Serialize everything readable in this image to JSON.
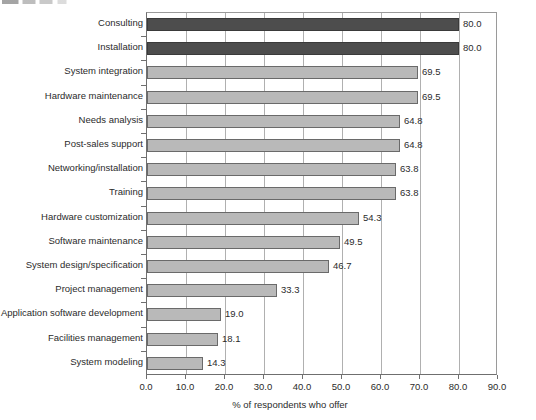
{
  "figure": {
    "caption_sliver": "",
    "background_color": "#ffffff"
  },
  "colors": {
    "bar_light": "#b9b9b9",
    "bar_dark": "#4d4d4d",
    "bar_border": "#6a6a6a",
    "gridline": "#b0b0b0",
    "axis": "#6f6f6f",
    "text": "#2b2b2b"
  },
  "chart_data": {
    "type": "bar",
    "orientation": "horizontal",
    "title": "",
    "subtitle": "",
    "xlabel": "% of respondents who offer",
    "ylabel": "",
    "xlim": [
      0.0,
      90.0
    ],
    "xticks": [
      "0.0",
      "10.0",
      "20.0",
      "30.0",
      "40.0",
      "50.0",
      "60.0",
      "70.0",
      "80.0",
      "90.0"
    ],
    "xtick_values": [
      0,
      10,
      20,
      30,
      40,
      50,
      60,
      70,
      80,
      90
    ],
    "grid": "vertical",
    "legend": "none",
    "categories": [
      "Consulting",
      "Installation",
      "System integration",
      "Hardware maintenance",
      "Needs analysis",
      "Post-sales support",
      "Networking/installation",
      "Training",
      "Hardware customization",
      "Software maintenance",
      "System design/specification",
      "Project management",
      "Application software development",
      "Facilities management",
      "System modeling"
    ],
    "values": [
      80.0,
      80.0,
      69.5,
      69.5,
      64.8,
      64.8,
      63.8,
      63.8,
      54.3,
      49.5,
      46.7,
      33.3,
      19.0,
      18.1,
      14.3
    ],
    "value_labels": [
      "80.0",
      "80.0",
      "69.5",
      "69.5",
      "64.8",
      "64.8",
      "63.8",
      "63.8",
      "54.3",
      "49.5",
      "46.7",
      "33.3",
      "19.0",
      "18.1",
      "14.3"
    ],
    "bar_styles": [
      "dark",
      "dark",
      "light",
      "light",
      "light",
      "light",
      "light",
      "light",
      "light",
      "light",
      "light",
      "light",
      "light",
      "light",
      "light"
    ]
  }
}
